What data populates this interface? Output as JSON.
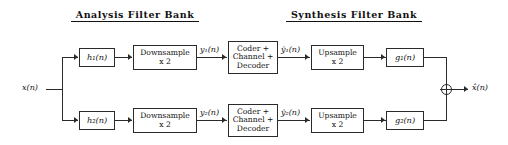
{
  "diagram": {
    "titles": {
      "analysis": "Analysis Filter Bank",
      "synthesis": "Synthesis Filter Bank"
    },
    "signals": {
      "input": "x(n)",
      "output": "x̂(n)",
      "y1": "y₁(n)",
      "y2": "y₂(n)",
      "y1_hat": "ŷ₁(n)",
      "y2_hat": "ŷ₂(n)"
    },
    "blocks": {
      "h1": "h₁(n)",
      "h2": "h₂(n)",
      "g1": "g₁(n)",
      "g2": "g₂(n)",
      "downsample1": "Downsample\nx 2",
      "downsample2": "Downsample\nx 2",
      "coder1": "Coder +\nChannel +\nDecoder",
      "coder2": "Coder +\nChannel +\nDecoder",
      "upsample1": "Upsample\nx 2",
      "upsample2": "Upsample\nx 2"
    },
    "summing_junction": "+",
    "colors": {
      "line": "#2a2a2a",
      "text": "#111111",
      "background": "#ffffff"
    }
  }
}
